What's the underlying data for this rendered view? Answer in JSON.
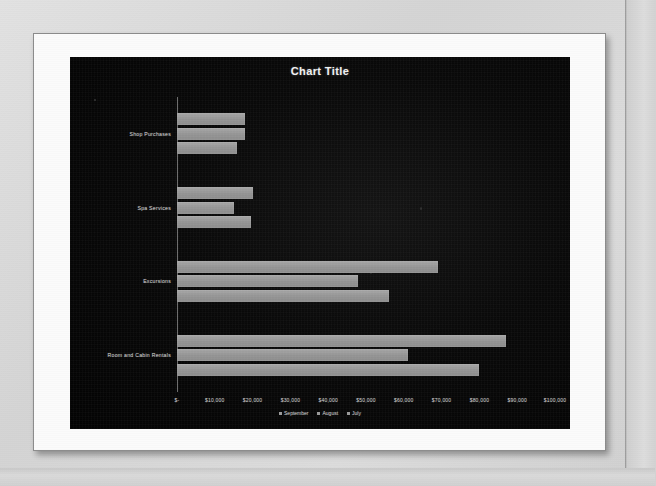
{
  "slide": {
    "name": "presentation-slide"
  },
  "chart": {
    "title": "Chart Title",
    "legend": [
      {
        "label": "September",
        "color": "#9a9a9a"
      },
      {
        "label": "August",
        "color": "#9a9a9a"
      },
      {
        "label": "July",
        "color": "#9a9a9a"
      }
    ],
    "axis_ticks": [
      " $-",
      " $10,000",
      " $20,000",
      " $30,000",
      " $40,000",
      " $50,000",
      " $60,000",
      " $70,000",
      " $80,000",
      " $90,000",
      " $100,000"
    ]
  },
  "chart_data": {
    "type": "bar",
    "orientation": "horizontal",
    "title": "Chart Title",
    "xlabel": "",
    "ylabel": "",
    "xlim": [
      0,
      100000
    ],
    "grid": false,
    "legend_position": "bottom",
    "categories": [
      "Shop Purchases",
      "Spa Services",
      "Excursions",
      "Room and Cabin Rentals"
    ],
    "series": [
      {
        "name": "September",
        "values": [
          18000,
          20000,
          69000,
          87000
        ]
      },
      {
        "name": "August",
        "values": [
          18000,
          15000,
          48000,
          61000
        ]
      },
      {
        "name": "July",
        "values": [
          16000,
          19500,
          56000,
          80000
        ]
      }
    ]
  }
}
